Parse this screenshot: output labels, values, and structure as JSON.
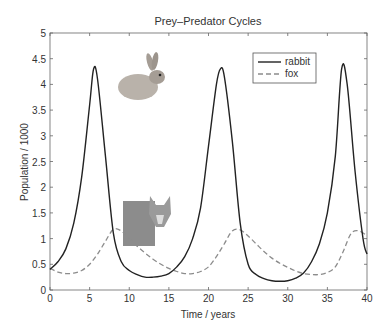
{
  "chart_data": {
    "type": "line",
    "title": "Prey–Predator Cycles",
    "xlabel": "Time / years",
    "ylabel": "Population / 1000",
    "xlim": [
      0,
      40
    ],
    "ylim": [
      0,
      5
    ],
    "xticks": [
      "0",
      "5",
      "10",
      "15",
      "20",
      "25",
      "30",
      "35",
      "40"
    ],
    "yticks": [
      "0",
      "0.5",
      "1",
      "1.5",
      "2",
      "2.5",
      "3",
      "3.5",
      "4",
      "4.5",
      "5"
    ],
    "legend": {
      "position": "upper-right",
      "entries": [
        "rabbit",
        "fox"
      ]
    },
    "grid": false,
    "series": [
      {
        "name": "rabbit",
        "style": "solid",
        "color": "#222222",
        "x": [
          0,
          1,
          2,
          3,
          4,
          5,
          5.5,
          6,
          7,
          8,
          9,
          10,
          11,
          12,
          13,
          14,
          15,
          16,
          17,
          18,
          19,
          20,
          21,
          21.5,
          22,
          23,
          24,
          25,
          26,
          27,
          28,
          29,
          30,
          31,
          32,
          33,
          34,
          35,
          36,
          36.8,
          37.5,
          38.5,
          39.5,
          40
        ],
        "y": [
          0.4,
          0.55,
          0.8,
          1.3,
          2.2,
          3.6,
          4.3,
          4.1,
          2.6,
          1.1,
          0.55,
          0.38,
          0.3,
          0.25,
          0.25,
          0.27,
          0.32,
          0.45,
          0.65,
          1.0,
          1.6,
          2.8,
          4.0,
          4.3,
          4.15,
          2.9,
          1.3,
          0.5,
          0.3,
          0.22,
          0.18,
          0.17,
          0.18,
          0.23,
          0.33,
          0.55,
          0.9,
          1.5,
          2.6,
          4.3,
          4.0,
          2.3,
          1.0,
          0.7
        ]
      },
      {
        "name": "fox",
        "style": "dashed",
        "color": "#888888",
        "x": [
          0,
          1,
          2,
          3,
          4,
          5,
          6,
          7,
          8,
          9,
          10,
          11,
          12,
          13,
          14,
          15,
          16,
          17,
          18,
          19,
          20,
          21,
          22,
          23,
          24,
          25,
          26,
          27,
          28,
          29,
          30,
          31,
          32,
          33,
          34,
          35,
          36,
          37,
          38,
          39,
          40
        ],
        "y": [
          0.42,
          0.35,
          0.32,
          0.33,
          0.38,
          0.5,
          0.7,
          0.95,
          1.18,
          1.15,
          1.0,
          0.85,
          0.72,
          0.6,
          0.5,
          0.42,
          0.36,
          0.32,
          0.32,
          0.36,
          0.45,
          0.65,
          0.9,
          1.15,
          1.17,
          1.05,
          0.9,
          0.75,
          0.62,
          0.52,
          0.44,
          0.37,
          0.32,
          0.3,
          0.3,
          0.34,
          0.45,
          0.75,
          1.1,
          1.15,
          1.05
        ]
      }
    ],
    "annotations": [
      "rabbit-image",
      "fox-image"
    ]
  },
  "frame": {
    "plot_left": 50,
    "plot_right": 367,
    "plot_top": 33,
    "plot_bottom": 290
  }
}
